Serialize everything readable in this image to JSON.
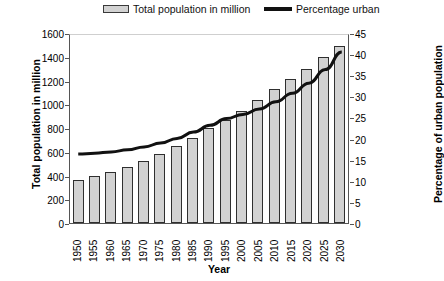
{
  "legend": {
    "bars_label": "Total population in million",
    "line_label": "Percentage urban",
    "bar_swatch_icon": "bar-swatch-icon",
    "line_swatch_icon": "line-swatch-icon"
  },
  "chart_data": {
    "type": "bar",
    "title": "",
    "xlabel": "Year",
    "ylabel": "Total population in million",
    "y2label": "Percentage of urban population",
    "categories": [
      "1950",
      "1955",
      "1960",
      "1965",
      "1970",
      "1975",
      "1980",
      "1985",
      "1990",
      "1995",
      "2000",
      "2005",
      "2010",
      "2015",
      "2020",
      "2025",
      "2030"
    ],
    "ylim": [
      0,
      1600
    ],
    "yticks": [
      0,
      200,
      400,
      600,
      800,
      1000,
      1200,
      1400,
      1600
    ],
    "y2lim": [
      0,
      45
    ],
    "y2ticks": [
      0,
      5,
      10,
      15,
      20,
      25,
      30,
      35,
      40,
      45
    ],
    "grid": false,
    "legend_position": "top",
    "series": [
      {
        "name": "Total population in million",
        "type": "bar",
        "axis": "left",
        "values": [
          362,
          400,
          430,
          470,
          525,
          580,
          650,
          720,
          800,
          870,
          945,
          1040,
          1130,
          1215,
          1300,
          1400,
          1490
        ]
      },
      {
        "name": "Percentage urban",
        "type": "line",
        "axis": "right",
        "values": [
          16.8,
          17.0,
          17.3,
          17.8,
          18.5,
          19.4,
          20.5,
          22.0,
          23.6,
          25.2,
          26.2,
          27.5,
          29.2,
          31.2,
          33.6,
          36.8,
          41.0
        ]
      }
    ]
  },
  "colors": {
    "bar_fill": "#d2d2d2",
    "bar_edge": "#2f2f2f",
    "line": "#111111",
    "axis": "#555555",
    "text": "#000000"
  }
}
